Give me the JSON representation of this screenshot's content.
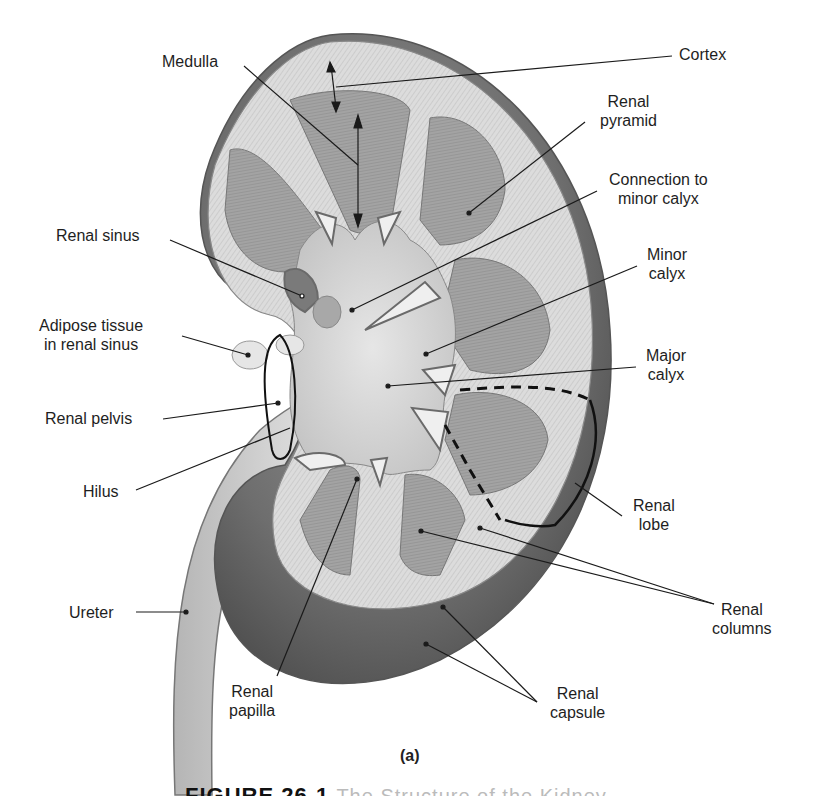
{
  "figure": {
    "panel_label": "(a)",
    "caption_partial": "FIGURE 26-1",
    "caption_rest_partial": "The Structure of the Kidney"
  },
  "colors": {
    "background": "#ffffff",
    "label_text": "#1e1e1e",
    "leader_line": "#1a1a1a",
    "capsule_dark": "#6a6a6a",
    "cortex_light": "#d9d9d9",
    "pyramid": "#9a9a9a",
    "sinus": "#cfcfcf",
    "ureter": "#bdbdbd"
  },
  "labels": {
    "medulla": [
      "Medulla"
    ],
    "cortex": [
      "Cortex"
    ],
    "renal_pyramid": [
      "Renal",
      "pyramid"
    ],
    "connection_minor_calyx": [
      "Connection to",
      "minor calyx"
    ],
    "minor_calyx": [
      "Minor",
      "calyx"
    ],
    "major_calyx": [
      "Major",
      "calyx"
    ],
    "renal_sinus": [
      "Renal sinus"
    ],
    "adipose_tissue": [
      "Adipose tissue",
      "in renal sinus"
    ],
    "renal_pelvis": [
      "Renal pelvis"
    ],
    "hilus": [
      "Hilus"
    ],
    "ureter": [
      "Ureter"
    ],
    "renal_lobe": [
      "Renal",
      "lobe"
    ],
    "renal_columns": [
      "Renal",
      "columns"
    ],
    "renal_papilla": [
      "Renal",
      "papilla"
    ],
    "renal_capsule": [
      "Renal",
      "capsule"
    ]
  }
}
